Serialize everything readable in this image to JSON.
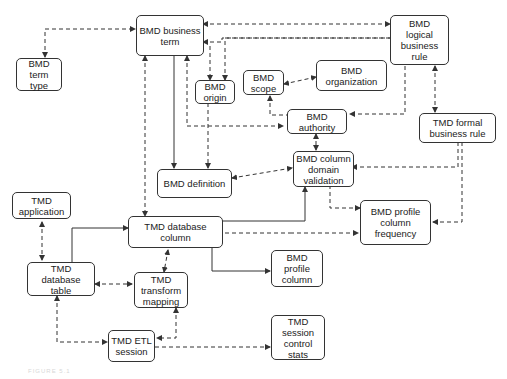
{
  "nodes": {
    "bmd_business_term": "BMD business\nterm",
    "bmd_term_type": "BMD\nterm\ntype",
    "bmd_logical_business_rule": "BMD\nlogical\nbusiness\nrule",
    "bmd_origin": "BMD\norigin",
    "bmd_scope": "BMD\nscope",
    "bmd_organization": "BMD\norganization",
    "bmd_authority": "BMD\nauthority",
    "tmd_formal_business_rule": "TMD formal\nbusiness rule",
    "bmd_column_domain_validation": "BMD column\ndomain\nvalidation",
    "bmd_definition": "BMD definition",
    "tmd_application": "TMD\napplication",
    "tmd_database_column": "TMD database\ncolumn",
    "bmd_profile_column_frequency": "BMD profile\ncolumn\nfrequency",
    "tmd_database_table": "TMD database\ntable",
    "tmd_transform_mapping": "TMD\ntransform\nmapping",
    "bmd_profile_column": "BMD\nprofile\ncolumn",
    "tmd_etl_session": "TMD ETL\nsession",
    "tmd_session_control_stats": "TMD\nsession\ncontrol\nstats"
  },
  "caption": "FIGURE 5.1",
  "colors": {
    "line": "#333333",
    "box_border": "#333333",
    "background": "#ffffff"
  }
}
